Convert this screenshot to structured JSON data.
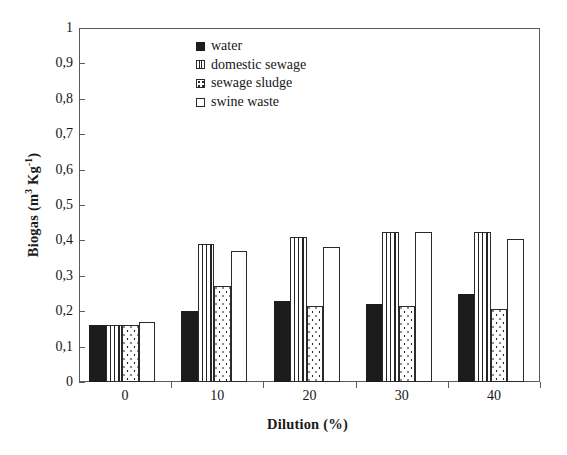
{
  "chart_data": {
    "type": "bar",
    "title": "",
    "xlabel": "Dilution (%)",
    "ylabel": "Biogas (m3 Kg-1)",
    "ylabel_parts": {
      "main": "Biogas (m",
      "sup1": "3",
      "mid": " Kg",
      "sup2": "-1",
      "end": ")"
    },
    "categories": [
      "0",
      "10",
      "20",
      "30",
      "40"
    ],
    "series": [
      {
        "name": "water",
        "key": "solid-black",
        "values": [
          0.16,
          0.2,
          0.23,
          0.22,
          0.25
        ]
      },
      {
        "name": "domestic sewage",
        "key": "vertical-lines",
        "values": [
          0.16,
          0.39,
          0.41,
          0.425,
          0.425
        ]
      },
      {
        "name": "sewage sludge",
        "key": "dotted",
        "values": [
          0.16,
          0.27,
          0.215,
          0.215,
          0.205
        ]
      },
      {
        "name": "swine waste",
        "key": "empty-white",
        "values": [
          0.17,
          0.37,
          0.38,
          0.425,
          0.405
        ]
      }
    ],
    "ylim": [
      0,
      1
    ],
    "yticks": [
      "0",
      "0,1",
      "0,2",
      "0,3",
      "0,4",
      "0,5",
      "0,6",
      "0,7",
      "0,8",
      "0,9",
      "1"
    ],
    "ytick_values": [
      0,
      0.1,
      0.2,
      0.3,
      0.4,
      0.5,
      0.6,
      0.7,
      0.8,
      0.9,
      1
    ],
    "grid": false,
    "legend_position": "top-center",
    "colors": {
      "bar_outline": "#2a2a2a",
      "solid_fill": "#1c1c1c",
      "axis": "#5a5a5a",
      "text": "#161616",
      "background": "#ffffff"
    }
  },
  "legend": {
    "items": [
      {
        "label": "water"
      },
      {
        "label": "domestic sewage"
      },
      {
        "label": "sewage sludge"
      },
      {
        "label": "swine waste"
      }
    ]
  }
}
